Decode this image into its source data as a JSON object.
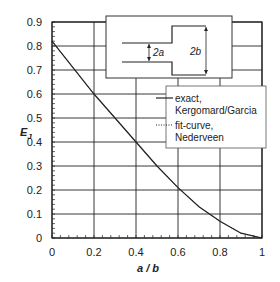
{
  "chart_data": {
    "type": "line",
    "title": "",
    "xlabel": "a / b",
    "ylabel": "E_J",
    "xlim": [
      0,
      1
    ],
    "ylim": [
      0,
      0.9
    ],
    "xticks": [
      "0",
      "0.2",
      "0.4",
      "0.6",
      "0.8",
      "1"
    ],
    "yticks": [
      "0",
      "0.1",
      "0.2",
      "0.3",
      "0.4",
      "0.5",
      "0.6",
      "0.7",
      "0.8",
      "0.9"
    ],
    "grid": true,
    "legend_position": "upper right",
    "series": [
      {
        "name": "exact, Kergomard/Garcia",
        "style": "solid",
        "x": [
          0,
          0.1,
          0.2,
          0.3,
          0.4,
          0.5,
          0.6,
          0.7,
          0.8,
          0.9,
          1.0
        ],
        "y": [
          0.82,
          0.71,
          0.6,
          0.5,
          0.4,
          0.3,
          0.21,
          0.13,
          0.07,
          0.02,
          0.0
        ]
      },
      {
        "name": "fit-curve, Nederveen",
        "style": "dotted",
        "x": [
          0,
          0.1,
          0.2,
          0.3,
          0.4,
          0.5,
          0.6,
          0.7,
          0.8,
          0.9,
          1.0
        ],
        "y": [
          0.82,
          0.71,
          0.6,
          0.5,
          0.4,
          0.3,
          0.21,
          0.13,
          0.07,
          0.02,
          0.0
        ]
      }
    ],
    "inset": {
      "description": "duct step from radius a to radius b",
      "labels": [
        "2a",
        "2b"
      ]
    }
  },
  "labels": {
    "ylabel_main": "E",
    "ylabel_sub": "J",
    "xlabel": "a / b",
    "legend_exact_1": "exact,",
    "legend_exact_2": "Kergomard/Garcia",
    "legend_fit_1": "fit-curve,",
    "legend_fit_2": "Nederveen",
    "inset_a": "2a",
    "inset_b": "2b"
  }
}
